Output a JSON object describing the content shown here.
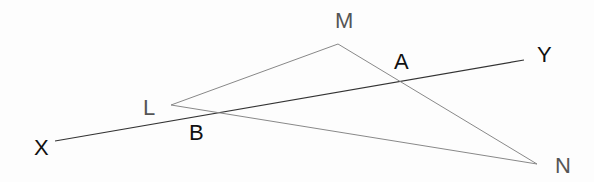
{
  "diagram": {
    "points": {
      "X": {
        "label": "X",
        "color": "#111111"
      },
      "Y": {
        "label": "Y",
        "color": "#111111"
      },
      "A": {
        "label": "A",
        "color": "#111111"
      },
      "B": {
        "label": "B",
        "color": "#111111"
      },
      "L": {
        "label": "L",
        "color": "#555555"
      },
      "M": {
        "label": "M",
        "color": "#555555"
      },
      "N": {
        "label": "N",
        "color": "#555555"
      }
    },
    "segments": [
      {
        "from": "X",
        "to": "Y",
        "color": "#333333"
      },
      {
        "from": "L",
        "to": "M",
        "color": "#888888"
      },
      {
        "from": "M",
        "to": "N",
        "color": "#888888"
      },
      {
        "from": "L",
        "to": "N",
        "color": "#888888"
      }
    ]
  }
}
